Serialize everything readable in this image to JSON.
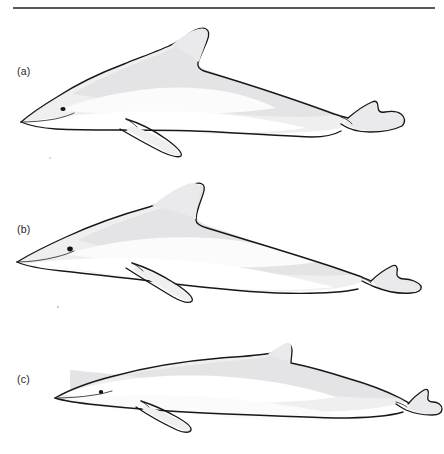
{
  "figure": {
    "type": "line-drawing-plate",
    "background_color": "#ffffff",
    "rule_color": "#58585c",
    "outline_color": "#17171a",
    "body_fill_color": "#efefef",
    "shadow_fill_color": "#e4e4e6",
    "pale_field_color": "#fbfbfb",
    "eye_color": "#121214",
    "panel_count": 3
  },
  "panels": [
    {
      "label": "(a)",
      "subject": "dolphin",
      "orientation": "left-facing lateral profile",
      "dorsal_fin": "tall falcate, strongly recurved with pointed tip",
      "rostrum": "short stubby beak",
      "body_build": "robust, deep-bodied",
      "flipper": "long pointed pectoral flipper, swept back",
      "fluke": "notched tail fluke with pointed tips",
      "flank_pattern": "pale elongated lateral blaze over gray body"
    },
    {
      "label": "(b)",
      "subject": "dolphin",
      "orientation": "left-facing lateral profile",
      "dorsal_fin": "tall falcate, curved with rounded leading edge",
      "rostrum": "long slender beak, poorly demarcated",
      "body_build": "slender, tapering tailstock",
      "flipper": "long narrow pectoral flipper, swept back",
      "fluke": "small notched tail fluke",
      "flank_pattern": "diffuse pale grey lateral field"
    },
    {
      "label": "(c)",
      "subject": "dolphin",
      "orientation": "left-facing lateral profile",
      "dorsal_fin": "small low triangular fin set far back",
      "rostrum": "long slender beak",
      "body_build": "elongate, streamlined",
      "flipper": "short pointed pectoral flipper",
      "fluke": "small narrow notched fluke",
      "flank_pattern": "broad white lateral blaze with grey dorsal cape"
    }
  ]
}
